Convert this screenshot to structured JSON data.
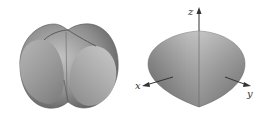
{
  "figures": [
    {
      "id": "left",
      "description": "Solid formed by intersection of sphere-like body and two cylinders (shaded gray surface)",
      "colors": {
        "light": "#c8c8c8",
        "mid": "#9a9a9a",
        "dark": "#5e5e5e"
      }
    },
    {
      "id": "right",
      "description": "Lens-shaped solid with coordinate axes",
      "axes": {
        "z": "z",
        "x": "x",
        "y": "y"
      },
      "colors": {
        "light": "#bdbdbd",
        "mid": "#959595",
        "dark": "#6a6a6a",
        "axis": "#333333"
      }
    }
  ]
}
